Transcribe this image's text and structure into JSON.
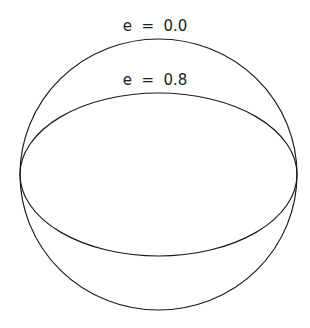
{
  "diagram": {
    "type": "ellipse-comparison",
    "center": {
      "x": 158.5,
      "y": 174.5
    },
    "semi_major_axis_px": 138.5,
    "stroke_color": "#1a1a1a",
    "background": "#ffffff",
    "shapes": [
      {
        "name": "circle",
        "eccentricity": 0.0,
        "label": "e  =  0.0",
        "ry_px": 135.5,
        "label_pos": {
          "x": 155,
          "y": 31
        }
      },
      {
        "name": "ellipse",
        "eccentricity": 0.8,
        "label": "e  =  0.8",
        "ry_px": 81.5,
        "label_pos": {
          "x": 155,
          "y": 85
        }
      }
    ]
  }
}
